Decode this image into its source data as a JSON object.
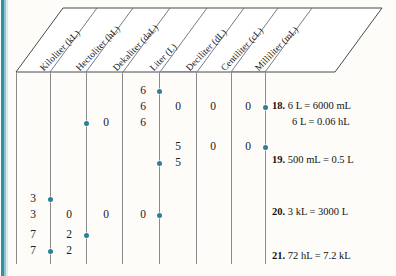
{
  "chart": {
    "columns": [
      {
        "id": "kiloliter",
        "label": "Kiloliter (kL)"
      },
      {
        "id": "hectoliter",
        "label": "Hectoliter (hL)"
      },
      {
        "id": "dekaliter",
        "label": "Dekaliter (daL)"
      },
      {
        "id": "liter",
        "label": "Liter (L)"
      },
      {
        "id": "deciliter",
        "label": "Deciliter (dL)"
      },
      {
        "id": "centiliter",
        "label": "Centiliter (cL)"
      },
      {
        "id": "milliliter",
        "label": "Milliliter (mL)"
      }
    ],
    "entries": [
      {
        "row": 1,
        "col": "liter",
        "value": "6"
      },
      {
        "row": 2,
        "col": "liter",
        "value": "6"
      },
      {
        "row": 2,
        "col": "deciliter",
        "value": "0"
      },
      {
        "row": 2,
        "col": "centiliter",
        "value": "0"
      },
      {
        "row": 2,
        "col": "milliliter",
        "value": "0"
      },
      {
        "row": 3,
        "col": "liter",
        "value": "6"
      },
      {
        "row": 3,
        "col": "dekaliter",
        "value": "0"
      },
      {
        "row": 4,
        "col": "deciliter",
        "value": "5"
      },
      {
        "row": 4,
        "col": "centiliter",
        "value": "0"
      },
      {
        "row": 4,
        "col": "milliliter",
        "value": "0"
      },
      {
        "row": 5,
        "col": "deciliter",
        "value": "5"
      },
      {
        "row": 6,
        "col": "kiloliter",
        "value": "3"
      },
      {
        "row": 7,
        "col": "kiloliter",
        "value": "3"
      },
      {
        "row": 7,
        "col": "hectoliter",
        "value": "0"
      },
      {
        "row": 7,
        "col": "dekaliter",
        "value": "0"
      },
      {
        "row": 7,
        "col": "liter",
        "value": "0"
      },
      {
        "row": 8,
        "col": "kiloliter",
        "value": "7"
      },
      {
        "row": 8,
        "col": "hectoliter",
        "value": "2"
      },
      {
        "row": 9,
        "col": "kiloliter",
        "value": "7"
      },
      {
        "row": 9,
        "col": "hectoliter",
        "value": "2"
      }
    ],
    "decimal_points": [
      {
        "row": 1,
        "after": "liter"
      },
      {
        "row": 2,
        "after": "milliliter"
      },
      {
        "row": 3,
        "after": "dekaliter"
      },
      {
        "row": 4,
        "after": "milliliter"
      },
      {
        "row": 5,
        "after": "liter"
      },
      {
        "row": 6,
        "after": "kiloliter"
      },
      {
        "row": 7,
        "after": "liter"
      },
      {
        "row": 8,
        "after": "hectoliter"
      },
      {
        "row": 9,
        "after": "kiloliter"
      }
    ]
  },
  "answers": [
    {
      "number": "18.",
      "line1": "6 L = 6000 mL",
      "line2": "6 L = 0.06 hL"
    },
    {
      "number": "19.",
      "line1": "500 mL = 0.5 L",
      "line2": ""
    },
    {
      "number": "20.",
      "line1": "3 kL = 3000 L",
      "line2": ""
    },
    {
      "number": "21.",
      "line1": "72 hL = 7.2 kL",
      "line2": ""
    }
  ],
  "colors": {
    "accent_dot": "#2b7f97",
    "spine": "#2f8fa3",
    "gridline": "#8a8a8a",
    "red_rule": "#c9736f",
    "background": "#fdfcf8"
  }
}
